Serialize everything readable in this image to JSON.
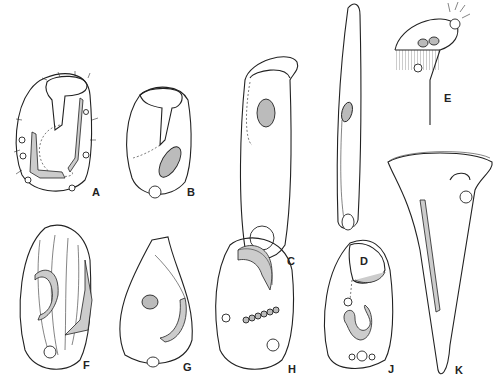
{
  "figure": {
    "background": "#ffffff",
    "ink_color": "#222222",
    "panels": [
      {
        "id": "A",
        "label": "A",
        "label_x": 92,
        "label_y": 187
      },
      {
        "id": "B",
        "label": "B",
        "label_x": 187,
        "label_y": 187
      },
      {
        "id": "C",
        "label": "C",
        "label_x": 287,
        "label_y": 256
      },
      {
        "id": "D",
        "label": "D",
        "label_x": 360,
        "label_y": 256
      },
      {
        "id": "E",
        "label": "E",
        "label_x": 444,
        "label_y": 93
      },
      {
        "id": "F",
        "label": "F",
        "label_x": 83,
        "label_y": 360
      },
      {
        "id": "G",
        "label": "G",
        "label_x": 183,
        "label_y": 362
      },
      {
        "id": "H",
        "label": "H",
        "label_x": 288,
        "label_y": 364
      },
      {
        "id": "J",
        "label": "J",
        "label_x": 388,
        "label_y": 364
      },
      {
        "id": "K",
        "label": "K",
        "label_x": 455,
        "label_y": 365
      }
    ]
  }
}
